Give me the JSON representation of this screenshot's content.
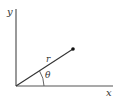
{
  "diagram": {
    "type": "polar-coordinates",
    "labels": {
      "y_axis": "y",
      "x_axis": "x",
      "radius": "r",
      "angle": "θ"
    },
    "colors": {
      "axis": "#555555",
      "line": "#333333",
      "point": "#111111",
      "text": "#333333"
    }
  }
}
